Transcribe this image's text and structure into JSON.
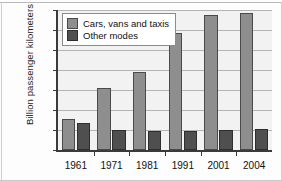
{
  "chart_data": {
    "type": "bar",
    "title": "",
    "xlabel": "",
    "ylabel": "Billion passenger kilometers",
    "categories": [
      "1961",
      "1971",
      "1981",
      "1991",
      "2001",
      "2004"
    ],
    "series": [
      {
        "name": "Cars, vans and taxis",
        "values": [
          157,
          310,
          390,
          585,
          675,
          683
        ],
        "color": "#8e8e8e"
      },
      {
        "name": "Other modes",
        "values": [
          133,
          102,
          97,
          93,
          98,
          105
        ],
        "color": "#4f4f4f"
      }
    ],
    "ylim": [
      0,
      700
    ],
    "yticks": [
      0,
      100,
      200,
      300,
      400,
      500,
      600,
      700
    ],
    "ytick_labels": [
      "0",
      "100",
      "200",
      "300",
      "400",
      "500",
      "600",
      "700"
    ],
    "grid": true,
    "legend_position": "top-left"
  },
  "legend": {
    "items": [
      {
        "label": "Cars, vans and taxis"
      },
      {
        "label": "Other modes"
      }
    ]
  }
}
